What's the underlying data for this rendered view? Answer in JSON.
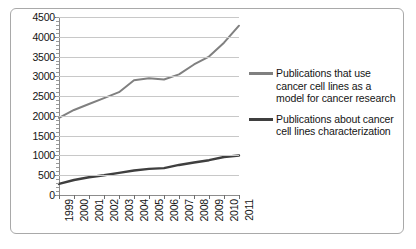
{
  "chart_data": {
    "type": "line",
    "title": "",
    "xlabel": "",
    "ylabel": "",
    "categories": [
      "1999",
      "2000",
      "2001",
      "2002",
      "2003",
      "2004",
      "2005",
      "2006",
      "2007",
      "2008",
      "2009",
      "2010",
      "2011"
    ],
    "ylim": [
      0,
      4500
    ],
    "ytick_step": 500,
    "yticks": [
      "4500",
      "4000",
      "3500",
      "3000",
      "2500",
      "2000",
      "1500",
      "1000",
      "500",
      "0"
    ],
    "grid": true,
    "legend_position": "right",
    "series": [
      {
        "name": "Publications that use cancer cell lines as a model for cancer research",
        "color": "#808080",
        "values": [
          1950,
          2150,
          2300,
          2450,
          2600,
          2900,
          2950,
          2920,
          3050,
          3300,
          3500,
          3850,
          4280
        ]
      },
      {
        "name": "Publications about cancer cell lines characterization",
        "color": "#3f3f3f",
        "values": [
          280,
          380,
          450,
          500,
          560,
          620,
          660,
          680,
          760,
          820,
          880,
          960,
          1000
        ]
      }
    ]
  },
  "legend": {
    "entries": [
      {
        "label": "Publications that use cancer cell lines as a model for cancer research",
        "color": "#808080"
      },
      {
        "label": "Publications about cancer cell lines characterization",
        "color": "#3f3f3f"
      }
    ]
  }
}
